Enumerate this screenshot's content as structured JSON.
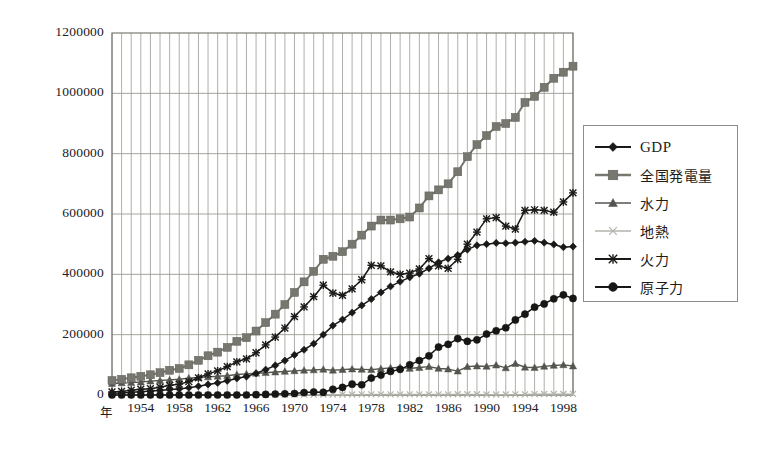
{
  "chart_data": {
    "type": "line",
    "title": "",
    "subtitle": "",
    "xlabel": "年",
    "ylabel": "",
    "xlim": [
      1951,
      1999
    ],
    "ylim": [
      0,
      1200000
    ],
    "grid": true,
    "grid_x_every": 1,
    "grid_y_every": 200000,
    "legend_position": "right",
    "ytick_labels": [
      "1200000",
      "1000000",
      "800000",
      "600000",
      "400000",
      "200000",
      "0"
    ],
    "yticks": [
      1200000,
      1000000,
      800000,
      600000,
      400000,
      200000,
      0
    ],
    "xtick_labels": [
      "1954",
      "1958",
      "1962",
      "1966",
      "1970",
      "1974",
      "1978",
      "1982",
      "1986",
      "1990",
      "1994",
      "1998"
    ],
    "xticks": [
      1954,
      1958,
      1962,
      1966,
      1970,
      1974,
      1978,
      1982,
      1986,
      1990,
      1994,
      1998
    ],
    "x": [
      1951,
      1952,
      1953,
      1954,
      1955,
      1956,
      1957,
      1958,
      1959,
      1960,
      1961,
      1962,
      1963,
      1964,
      1965,
      1966,
      1967,
      1968,
      1969,
      1970,
      1971,
      1972,
      1973,
      1974,
      1975,
      1976,
      1977,
      1978,
      1979,
      1980,
      1981,
      1982,
      1983,
      1984,
      1985,
      1986,
      1987,
      1988,
      1989,
      1990,
      1991,
      1992,
      1993,
      1994,
      1995,
      1996,
      1997,
      1998,
      1999
    ],
    "series": [
      {
        "name": "GDP",
        "marker": "diamond",
        "color": "#1a1a18",
        "values": [
          6000,
          7000,
          9000,
          11000,
          13000,
          15000,
          18000,
          20000,
          24000,
          29000,
          35000,
          40000,
          47000,
          55000,
          61000,
          72000,
          84000,
          98000,
          114000,
          133000,
          150000,
          170000,
          200000,
          230000,
          250000,
          273000,
          297000,
          318000,
          340000,
          360000,
          376000,
          390000,
          402000,
          420000,
          440000,
          452000,
          464000,
          482000,
          496000,
          500000,
          504000,
          503000,
          505000,
          508000,
          511000,
          505000,
          499000,
          490000,
          492000
        ]
      },
      {
        "name": "全国発電量",
        "marker": "square",
        "color": "#77776f",
        "values": [
          48000,
          52000,
          57000,
          62000,
          67000,
          74000,
          82000,
          88000,
          100000,
          115000,
          130000,
          142000,
          158000,
          178000,
          190000,
          212000,
          240000,
          268000,
          300000,
          340000,
          375000,
          410000,
          450000,
          460000,
          475000,
          500000,
          530000,
          560000,
          580000,
          580000,
          584000,
          590000,
          620000,
          660000,
          680000,
          700000,
          740000,
          790000,
          830000,
          860000,
          890000,
          900000,
          920000,
          970000,
          990000,
          1020000,
          1050000,
          1070000,
          1090000
        ]
      },
      {
        "name": "水力",
        "marker": "triangle",
        "color": "#55554f",
        "values": [
          38000,
          40000,
          41000,
          43000,
          46000,
          48000,
          50000,
          52000,
          56000,
          58000,
          60000,
          62000,
          64000,
          68000,
          70000,
          72000,
          74000,
          76000,
          78000,
          80000,
          82000,
          83000,
          85000,
          82000,
          84000,
          86000,
          85000,
          84000,
          87000,
          90000,
          92000,
          88000,
          91000,
          94000,
          88000,
          86000,
          79000,
          94000,
          96000,
          95000,
          99000,
          90000,
          104000,
          92000,
          91000,
          95000,
          98000,
          100000,
          96000
        ]
      },
      {
        "name": "地熱",
        "marker": "x",
        "color": "#b3b3ab",
        "values": [
          0,
          0,
          0,
          0,
          0,
          0,
          0,
          0,
          0,
          0,
          0,
          500,
          600,
          700,
          800,
          900,
          1000,
          1000,
          1100,
          1200,
          1300,
          1400,
          1500,
          1600,
          1700,
          1800,
          1900,
          2000,
          2000,
          2000,
          2100,
          2100,
          2200,
          2200,
          2200,
          2300,
          2400,
          2500,
          2600,
          1700,
          1800,
          1800,
          1900,
          2000,
          3000,
          3200,
          3300,
          3400,
          3500
        ]
      },
      {
        "name": "火力",
        "marker": "star",
        "color": "#1a1a18",
        "values": [
          10000,
          12000,
          16000,
          19000,
          21000,
          26000,
          32000,
          36000,
          44000,
          57000,
          70000,
          80000,
          94000,
          110000,
          120000,
          140000,
          166000,
          192000,
          222000,
          260000,
          292000,
          326000,
          364000,
          338000,
          330000,
          352000,
          382000,
          430000,
          428000,
          408000,
          400000,
          404000,
          418000,
          452000,
          428000,
          420000,
          450000,
          500000,
          540000,
          584000,
          588000,
          560000,
          550000,
          612000,
          614000,
          612000,
          606000,
          640000,
          670000
        ]
      },
      {
        "name": "原子力",
        "marker": "circle",
        "color": "#171715",
        "values": [
          0,
          0,
          0,
          0,
          0,
          0,
          0,
          0,
          0,
          0,
          0,
          0,
          0,
          0,
          0,
          1000,
          2000,
          3000,
          4000,
          5000,
          8000,
          10000,
          9000,
          19000,
          25000,
          36000,
          34000,
          56000,
          66000,
          78000,
          85000,
          100000,
          114000,
          130000,
          159000,
          168000,
          187000,
          178000,
          183000,
          202000,
          213000,
          223000,
          249000,
          268000,
          291000,
          302000,
          319000,
          332000,
          320000
        ]
      }
    ]
  },
  "legend": {
    "title": "",
    "items": [
      {
        "label": "GDP",
        "key": "gdp"
      },
      {
        "label": "全国発電量",
        "key": "national-generation"
      },
      {
        "label": "水力",
        "key": "hydro"
      },
      {
        "label": "地熱",
        "key": "geothermal"
      },
      {
        "label": "火力",
        "key": "thermal"
      },
      {
        "label": "原子力",
        "key": "nuclear"
      }
    ]
  },
  "axes": {
    "x_axis_name": "年"
  },
  "colors": {
    "gdp": "#1a1a18",
    "national_generation": "#77776f",
    "hydro": "#55554f",
    "geothermal": "#b3b3ab",
    "thermal": "#1a1a18",
    "nuclear": "#171715",
    "grid": "#9a9a93",
    "plot_border": "#6f6f69",
    "text": "#20201e"
  }
}
